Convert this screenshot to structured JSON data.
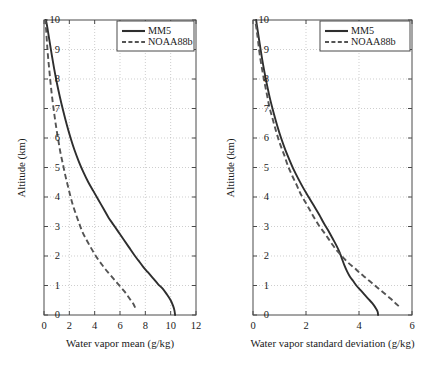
{
  "figure": {
    "background": "#ffffff",
    "panel_count": 2
  },
  "colors": {
    "mm5_line": "#2e2e2e",
    "noaa_line": "#545454",
    "axis": "#4a4a4a",
    "grid": "#b9b9b9",
    "text": "#1a1a1a"
  },
  "legend": {
    "mm5_label": "MM5",
    "noaa_label": "NOAA88b"
  },
  "panels": {
    "left": {
      "xlabel": "Water vapor mean (g/kg)",
      "ylabel": "Altitude (km)",
      "xticks": [
        "0",
        "2",
        "4",
        "6",
        "8",
        "10",
        "12"
      ],
      "yticks": [
        "0",
        "1",
        "2",
        "3",
        "4",
        "5",
        "6",
        "7",
        "8",
        "9",
        "10"
      ]
    },
    "right": {
      "xlabel": "Water vapor standard deviation (g/kg)",
      "ylabel": "Altitude (km)",
      "xticks": [
        "0",
        "2",
        "4",
        "6"
      ],
      "yticks": [
        "0",
        "1",
        "2",
        "3",
        "4",
        "5",
        "6",
        "7",
        "8",
        "9",
        "10"
      ]
    }
  },
  "chart_data": [
    {
      "type": "line",
      "panel": "left",
      "title": "",
      "xlabel": "Water vapor mean (g/kg)",
      "ylabel": "Altitude (km)",
      "xlim": [
        0,
        12
      ],
      "ylim": [
        0,
        10
      ],
      "xticks": [
        0,
        2,
        4,
        6,
        8,
        10,
        12
      ],
      "yticks": [
        0,
        1,
        2,
        3,
        4,
        5,
        6,
        7,
        8,
        9,
        10
      ],
      "grid": true,
      "legend_position": "upper right",
      "orientation": "x=value, y=altitude",
      "series": [
        {
          "name": "MM5",
          "style": "solid",
          "color": "#2e2e2e",
          "points": [
            [
              10.35,
              0.0
            ],
            [
              10.3,
              0.15
            ],
            [
              10.2,
              0.3
            ],
            [
              10.0,
              0.5
            ],
            [
              9.7,
              0.7
            ],
            [
              9.35,
              0.9
            ],
            [
              9.0,
              1.05
            ],
            [
              8.6,
              1.25
            ],
            [
              8.2,
              1.45
            ],
            [
              7.8,
              1.65
            ],
            [
              7.45,
              1.85
            ],
            [
              7.1,
              2.05
            ],
            [
              6.7,
              2.3
            ],
            [
              6.3,
              2.55
            ],
            [
              5.9,
              2.8
            ],
            [
              5.5,
              3.05
            ],
            [
              5.1,
              3.3
            ],
            [
              4.7,
              3.6
            ],
            [
              4.3,
              3.9
            ],
            [
              3.9,
              4.2
            ],
            [
              3.5,
              4.5
            ],
            [
              3.1,
              4.85
            ],
            [
              2.75,
              5.2
            ],
            [
              2.4,
              5.6
            ],
            [
              2.1,
              6.0
            ],
            [
              1.8,
              6.45
            ],
            [
              1.5,
              6.95
            ],
            [
              1.25,
              7.4
            ],
            [
              1.0,
              7.9
            ],
            [
              0.8,
              8.35
            ],
            [
              0.62,
              8.8
            ],
            [
              0.45,
              9.25
            ],
            [
              0.32,
              9.6
            ],
            [
              0.22,
              9.85
            ],
            [
              0.15,
              10.0
            ]
          ]
        },
        {
          "name": "NOAA88b",
          "style": "dashed",
          "color": "#545454",
          "points": [
            [
              7.2,
              0.25
            ],
            [
              7.05,
              0.38
            ],
            [
              6.85,
              0.5
            ],
            [
              6.6,
              0.65
            ],
            [
              6.35,
              0.8
            ],
            [
              6.05,
              0.95
            ],
            [
              5.75,
              1.1
            ],
            [
              5.45,
              1.25
            ],
            [
              5.15,
              1.4
            ],
            [
              4.85,
              1.55
            ],
            [
              4.55,
              1.72
            ],
            [
              4.25,
              1.9
            ],
            [
              3.95,
              2.1
            ],
            [
              3.65,
              2.32
            ],
            [
              3.35,
              2.55
            ],
            [
              3.05,
              2.8
            ],
            [
              2.8,
              3.08
            ],
            [
              2.55,
              3.38
            ],
            [
              2.3,
              3.7
            ],
            [
              2.1,
              4.0
            ],
            [
              1.9,
              4.35
            ],
            [
              1.7,
              4.7
            ],
            [
              1.5,
              5.1
            ],
            [
              1.3,
              5.5
            ],
            [
              1.12,
              5.95
            ],
            [
              0.95,
              6.4
            ],
            [
              0.8,
              6.85
            ],
            [
              0.65,
              7.35
            ],
            [
              0.52,
              7.85
            ],
            [
              0.42,
              8.3
            ],
            [
              0.32,
              8.75
            ],
            [
              0.24,
              9.2
            ],
            [
              0.18,
              9.6
            ],
            [
              0.13,
              9.85
            ],
            [
              0.1,
              10.0
            ]
          ]
        }
      ]
    },
    {
      "type": "line",
      "panel": "right",
      "title": "",
      "xlabel": "Water vapor standard deviation (g/kg)",
      "ylabel": "Altitude (km)",
      "xlim": [
        0,
        6
      ],
      "ylim": [
        0,
        10
      ],
      "xticks": [
        0,
        2,
        4,
        6
      ],
      "yticks": [
        0,
        1,
        2,
        3,
        4,
        5,
        6,
        7,
        8,
        9,
        10
      ],
      "grid": true,
      "legend_position": "upper right",
      "orientation": "x=value, y=altitude",
      "series": [
        {
          "name": "MM5",
          "style": "solid",
          "color": "#2e2e2e",
          "points": [
            [
              4.72,
              0.0
            ],
            [
              4.7,
              0.12
            ],
            [
              4.62,
              0.25
            ],
            [
              4.5,
              0.4
            ],
            [
              4.35,
              0.55
            ],
            [
              4.2,
              0.7
            ],
            [
              4.05,
              0.85
            ],
            [
              3.9,
              1.0
            ],
            [
              3.78,
              1.15
            ],
            [
              3.66,
              1.3
            ],
            [
              3.55,
              1.48
            ],
            [
              3.45,
              1.68
            ],
            [
              3.36,
              1.9
            ],
            [
              3.28,
              2.1
            ],
            [
              3.15,
              2.35
            ],
            [
              3.0,
              2.6
            ],
            [
              2.85,
              2.85
            ],
            [
              2.68,
              3.1
            ],
            [
              2.5,
              3.4
            ],
            [
              2.3,
              3.7
            ],
            [
              2.1,
              4.0
            ],
            [
              1.9,
              4.3
            ],
            [
              1.72,
              4.6
            ],
            [
              1.55,
              4.9
            ],
            [
              1.38,
              5.25
            ],
            [
              1.22,
              5.6
            ],
            [
              1.06,
              6.0
            ],
            [
              0.92,
              6.4
            ],
            [
              0.78,
              6.85
            ],
            [
              0.65,
              7.3
            ],
            [
              0.54,
              7.75
            ],
            [
              0.44,
              8.2
            ],
            [
              0.35,
              8.65
            ],
            [
              0.27,
              9.1
            ],
            [
              0.2,
              9.5
            ],
            [
              0.15,
              9.8
            ],
            [
              0.12,
              10.0
            ]
          ]
        },
        {
          "name": "NOAA88b",
          "style": "dashed",
          "color": "#545454",
          "points": [
            [
              5.5,
              0.3
            ],
            [
              5.35,
              0.42
            ],
            [
              5.2,
              0.55
            ],
            [
              5.0,
              0.7
            ],
            [
              4.8,
              0.85
            ],
            [
              4.6,
              1.0
            ],
            [
              4.4,
              1.15
            ],
            [
              4.2,
              1.3
            ],
            [
              4.0,
              1.45
            ],
            [
              3.82,
              1.6
            ],
            [
              3.62,
              1.75
            ],
            [
              3.45,
              1.9
            ],
            [
              3.3,
              2.05
            ],
            [
              3.15,
              2.2
            ],
            [
              3.0,
              2.38
            ],
            [
              2.85,
              2.58
            ],
            [
              2.68,
              2.8
            ],
            [
              2.5,
              3.02
            ],
            [
              2.32,
              3.28
            ],
            [
              2.15,
              3.55
            ],
            [
              1.98,
              3.82
            ],
            [
              1.8,
              4.1
            ],
            [
              1.65,
              4.4
            ],
            [
              1.48,
              4.72
            ],
            [
              1.32,
              5.05
            ],
            [
              1.18,
              5.42
            ],
            [
              1.02,
              5.8
            ],
            [
              0.88,
              6.2
            ],
            [
              0.75,
              6.62
            ],
            [
              0.62,
              7.05
            ],
            [
              0.52,
              7.5
            ],
            [
              0.42,
              7.95
            ],
            [
              0.33,
              8.4
            ],
            [
              0.25,
              8.85
            ],
            [
              0.19,
              9.3
            ],
            [
              0.14,
              9.65
            ],
            [
              0.1,
              9.9
            ],
            [
              0.09,
              10.0
            ]
          ]
        }
      ]
    }
  ]
}
